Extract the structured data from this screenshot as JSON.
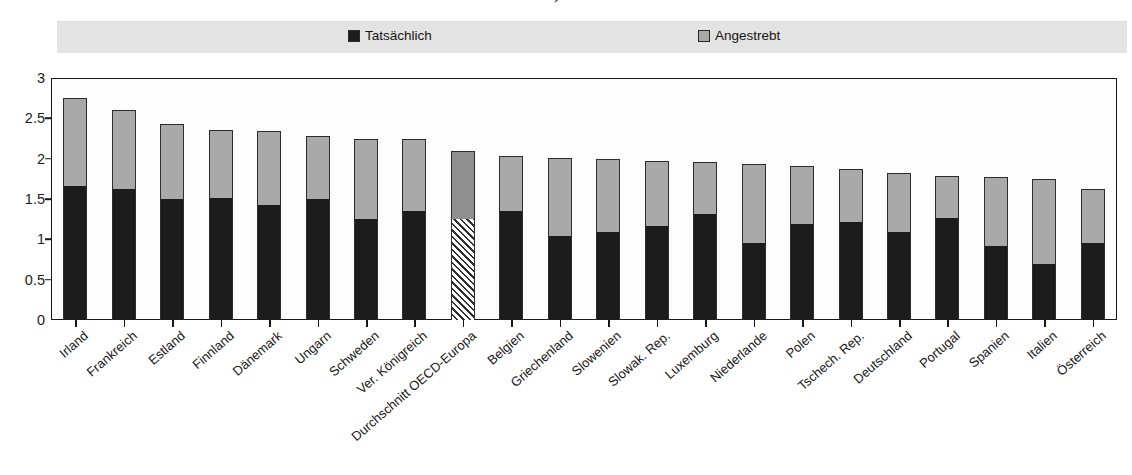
{
  "title": "…durchschnittliche Kinderzahl, Frauen im Alter von 24-39 Jahren",
  "legend": {
    "actual": {
      "label": "Tatsächlich",
      "swatch": "black-square-icon",
      "color": "#1d1d1d"
    },
    "desired": {
      "label": "Angestrebt",
      "swatch": "gray-square-icon",
      "color": "#a8a8a8"
    }
  },
  "axis": {
    "y_ticks": [
      "0",
      "0.5",
      "1",
      "1.5",
      "2",
      "2.5",
      "3"
    ],
    "y_min": 0,
    "y_max": 3,
    "y_step": 0.5
  },
  "chart_data": {
    "type": "bar",
    "title": "…durchschnittliche Kinderzahl, Frauen im Alter von 24-39 Jahren",
    "xlabel": "",
    "ylabel": "",
    "ylim": [
      0,
      3
    ],
    "grid": false,
    "legend_position": "top",
    "stacked": true,
    "note": "Bars are stacked: 'Tatsächlich' is the lower (black) segment; the bar total equals 'Angestrebt'. The 'Durchschnitt OECD-Europa' bar is drawn hatched/highlighted.",
    "categories": [
      "Irland",
      "Frankreich",
      "Estland",
      "Finnland",
      "Dänemark",
      "Ungarn",
      "Schweden",
      "Ver. Königreich",
      "Durchschnitt OECD-Europa",
      "Belgien",
      "Griechenland",
      "Slowenien",
      "Slowak. Rep.",
      "Luxemburg",
      "Niederlande",
      "Polen",
      "Tschech. Rep.",
      "Deutschland",
      "Portugal",
      "Spanien",
      "Italien",
      "Österreich"
    ],
    "series": [
      {
        "name": "Tatsächlich",
        "color": "#1d1d1d",
        "values": [
          1.66,
          1.63,
          1.5,
          1.51,
          1.42,
          1.5,
          1.25,
          1.35,
          1.25,
          1.35,
          1.04,
          1.09,
          1.17,
          1.31,
          0.95,
          1.19,
          1.22,
          1.09,
          1.27,
          0.92,
          0.7,
          0.96
        ]
      },
      {
        "name": "Angestrebt",
        "color": "#a9a9a9",
        "values": [
          2.75,
          2.6,
          2.43,
          2.36,
          2.34,
          2.28,
          2.25,
          2.25,
          2.09,
          2.03,
          2.01,
          1.99,
          1.97,
          1.96,
          1.93,
          1.91,
          1.87,
          1.82,
          1.78,
          1.77,
          1.75,
          1.63
        ]
      }
    ],
    "highlight_category": "Durchschnitt OECD-Europa"
  }
}
